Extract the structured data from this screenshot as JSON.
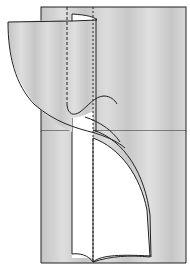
{
  "diagram": {
    "type": "fabric-folding-illustration",
    "colors": {
      "background": "#ffffff",
      "fabric": "#c8c8c8",
      "fabric_light": "#dcdcdc",
      "outline": "#222222",
      "lining": "#ffffff"
    },
    "elements": [
      "fabric-panel",
      "folded-flap",
      "white-lining-strip",
      "dashed-fold-lines",
      "curved-seam-line",
      "lower-lining-curve"
    ]
  }
}
